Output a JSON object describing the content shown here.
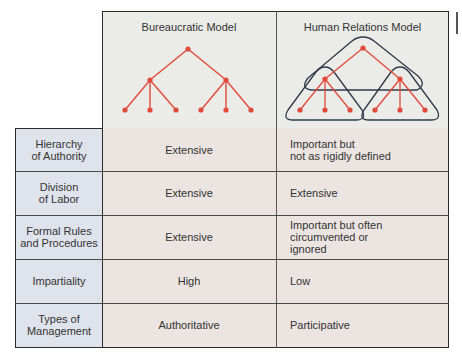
{
  "header": {
    "columns": [
      {
        "title": "Bureaucratic Model"
      },
      {
        "title": "Human Relations Model"
      }
    ]
  },
  "rows": [
    {
      "label": "Hierarchy\nof Authority",
      "bureaucratic": "Extensive",
      "human_relations": "Important but\nnot as rigidly defined"
    },
    {
      "label": "Division\nof Labor",
      "bureaucratic": "Extensive",
      "human_relations": "Extensive"
    },
    {
      "label": "Formal Rules\nand Procedures",
      "bureaucratic": "Extensive",
      "human_relations": "Important but often\ncircumvented or\nignored"
    },
    {
      "label": "Impartiality",
      "bureaucratic": "High",
      "human_relations": "Low"
    },
    {
      "label": "Types of\nManagement",
      "bureaucratic": "Authoritative",
      "human_relations": "Participative"
    }
  ],
  "diagram": {
    "colors": {
      "tree": "#e04a3a",
      "group_outline": "#2e3a4a",
      "header_bg": "#ebebe8",
      "label_bg": "#dfe3ec",
      "body_bg": "#ebe4e0"
    },
    "bureaucratic_tree": {
      "root": [
        188,
        49
      ],
      "mid": [
        [
          150,
          80
        ],
        [
          226,
          80
        ]
      ],
      "leaves": [
        [
          125,
          110
        ],
        [
          150,
          110
        ],
        [
          176,
          110
        ],
        [
          201,
          110
        ],
        [
          226,
          110
        ],
        [
          251,
          110
        ]
      ]
    },
    "human_relations_tree": {
      "root": [
        363,
        48
      ],
      "mid": [
        [
          325,
          79
        ],
        [
          400,
          79
        ]
      ],
      "leaves": [
        [
          300,
          110
        ],
        [
          325,
          110
        ],
        [
          350,
          110
        ],
        [
          375,
          110
        ],
        [
          400,
          110
        ],
        [
          425,
          110
        ]
      ]
    }
  }
}
